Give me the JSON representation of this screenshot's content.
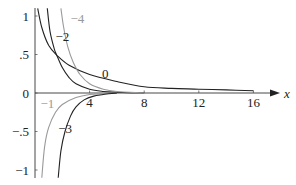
{
  "chart_data": {
    "type": "line",
    "title": "",
    "xlabel": "x",
    "ylabel": "",
    "xlim": [
      0,
      17
    ],
    "ylim": [
      -1.1,
      1.1
    ],
    "grid": false,
    "legend": "none (inline curve labels)",
    "x_ticks": [
      4,
      8,
      12,
      16
    ],
    "x_tick_labels": [
      "4",
      "8",
      "12",
      "16"
    ],
    "y_ticks": [
      1,
      0.5,
      0,
      -0.5,
      -1
    ],
    "y_tick_labels": [
      "1",
      ".5",
      "0",
      "−.5",
      "−1"
    ],
    "series": [
      {
        "name": "0",
        "color": "#222222",
        "x": [
          0.2,
          0.5,
          1,
          1.6,
          2.5,
          4,
          6,
          8,
          10,
          12,
          14,
          16
        ],
        "y": [
          1.1,
          0.85,
          0.62,
          0.49,
          0.36,
          0.24,
          0.15,
          0.08,
          0.06,
          0.05,
          0.04,
          0.03
        ]
      },
      {
        "name": "−2",
        "color": "#222222",
        "x": [
          0.9,
          1.1,
          1.4,
          1.6,
          2,
          2.5,
          3,
          4,
          5,
          6,
          8
        ],
        "y": [
          1.1,
          0.8,
          0.58,
          0.49,
          0.33,
          0.2,
          0.12,
          0.05,
          0.02,
          0.01,
          0.0
        ]
      },
      {
        "name": "−4",
        "color": "#999999",
        "x": [
          1.9,
          2.1,
          2.4,
          2.8,
          3.3,
          4,
          5,
          6,
          8
        ],
        "y": [
          1.1,
          0.85,
          0.6,
          0.4,
          0.24,
          0.12,
          0.05,
          0.02,
          0.0
        ]
      },
      {
        "name": "−1",
        "color": "#999999",
        "x": [
          0.5,
          0.7,
          1,
          1.5,
          2,
          3,
          4,
          5,
          6
        ],
        "y": [
          -1.1,
          -0.7,
          -0.45,
          -0.25,
          -0.15,
          -0.06,
          -0.02,
          -0.01,
          0.0
        ]
      },
      {
        "name": "−3",
        "color": "#222222",
        "x": [
          1.7,
          1.9,
          2.2,
          2.6,
          3,
          3.6,
          4.3,
          5,
          6
        ],
        "y": [
          -1.1,
          -0.75,
          -0.5,
          -0.3,
          -0.18,
          -0.09,
          -0.04,
          -0.02,
          0.0
        ]
      }
    ],
    "annotations": [
      {
        "text": "0",
        "x": 4.9,
        "y": 0.2
      },
      {
        "text": "−2",
        "x": 1.5,
        "y": 0.68
      },
      {
        "text": "−4",
        "x": 2.6,
        "y": 0.91
      },
      {
        "text": "−1",
        "x": 0.4,
        "y": -0.2
      },
      {
        "text": "−3",
        "x": 1.7,
        "y": -0.52
      }
    ]
  }
}
